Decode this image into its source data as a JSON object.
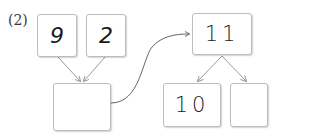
{
  "problem_label": "(2)",
  "left_group": {
    "top_boxes": [
      {
        "value": "9"
      },
      {
        "value": "2"
      }
    ],
    "result_box": {
      "value": ""
    }
  },
  "right_group": {
    "top_box": {
      "value": "11"
    },
    "bottom_boxes": [
      {
        "value": "10"
      },
      {
        "value": ""
      }
    ]
  },
  "colors": {
    "box_border": "#bdbdbd",
    "arrow": "#9a9a9a",
    "curve": "#555555",
    "text": "#1a1a1a"
  }
}
